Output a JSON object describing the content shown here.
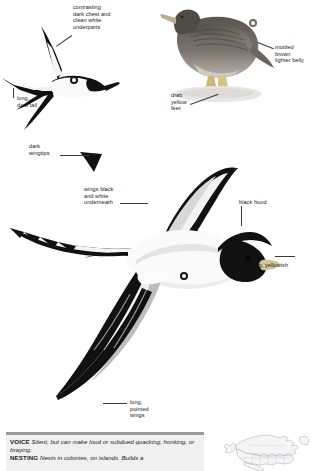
{
  "plate": {
    "title": "Masked Booby field guide plate",
    "background_color": "#ffffff",
    "ink_color": "#111111"
  },
  "annotations": [
    {
      "id": "contrasting-chest",
      "text": "contrasting\ndark chest and\nclean white\nunderparts",
      "align": "left",
      "x": 73,
      "y": 4
    },
    {
      "id": "long-dark-tail",
      "text": "long,\ndark tail",
      "align": "left",
      "x": 14,
      "y": 97
    },
    {
      "id": "dark-wingtips",
      "text": "dark\nwingtips",
      "align": "left",
      "x": 29,
      "y": 143
    },
    {
      "id": "mottled-brown-belly",
      "text": "mottled\nbrown\nlighter belly",
      "align": "left",
      "x": 273,
      "y": 46
    },
    {
      "id": "drab-yellow-feet",
      "text": "drab\nyellow\nfeet",
      "align": "left",
      "x": 171,
      "y": 92
    },
    {
      "id": "wings-black-white",
      "text": "wings black\nand white\nunderneath",
      "align": "left",
      "x": 84,
      "y": 186
    },
    {
      "id": "black-hood",
      "text": "black hood",
      "align": "left",
      "x": 239,
      "y": 199
    },
    {
      "id": "long-yellowish-bill",
      "text": "long, yellowish\nbill",
      "align": "left",
      "x": 251,
      "y": 263
    },
    {
      "id": "long-pointed-wings",
      "text": "long,\npointed\nwings",
      "align": "left",
      "x": 130,
      "y": 400
    }
  ],
  "badges": [
    {
      "id": "badge-flying-small",
      "x": 70,
      "y": 76,
      "size": 8
    },
    {
      "id": "badge-perched",
      "x": 249,
      "y": 19,
      "size": 8
    },
    {
      "id": "badge-flying-large",
      "x": 180,
      "y": 272,
      "size": 8
    }
  ],
  "info_box": {
    "entries": [
      {
        "keyword": "VOICE",
        "text": "Silent, but can make loud or subdued quacking, honking, or braying."
      },
      {
        "keyword": "NESTING",
        "text": "Nests in colonies, on islands. Builds a"
      }
    ]
  },
  "range_map": {
    "label": "North America range map",
    "outline_color": "#9aa0a6",
    "fill_color": "#f4f4f4"
  }
}
